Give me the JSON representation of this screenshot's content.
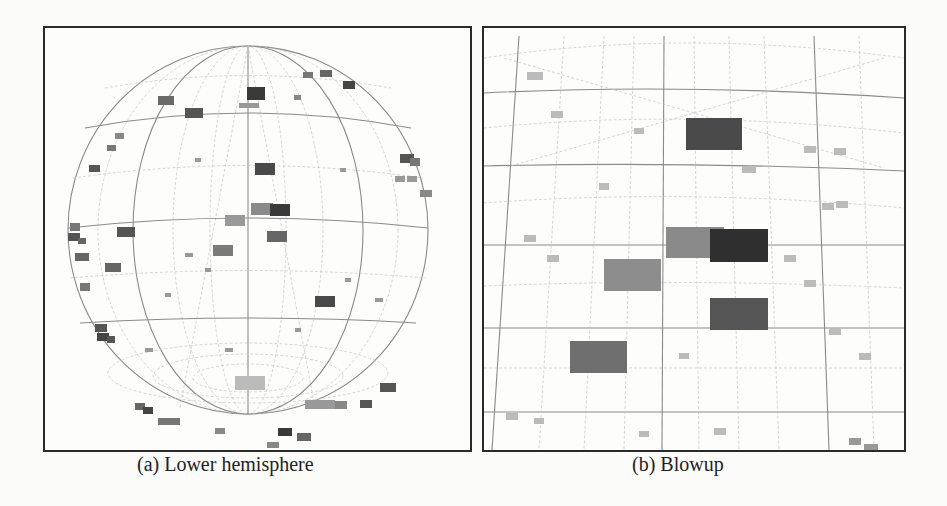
{
  "figure": {
    "panels": [
      {
        "id": "a",
        "caption": "(a) Lower hemisphere",
        "content": "sphere of image thumbnails with latitude/longitude grid, viewed from below"
      },
      {
        "id": "b",
        "caption": "(b) Blowup",
        "content": "zoomed region of the sphere showing larger image thumbnails on grid"
      }
    ],
    "colors": {
      "frame": "#2a2a2a",
      "grid": "#8a8a8a",
      "thumbnail_dark": "#3a3a3a",
      "thumbnail_mid": "#6f6f6f",
      "thumbnail_light": "#a8a8a8",
      "background": "#fbfbf9"
    }
  }
}
